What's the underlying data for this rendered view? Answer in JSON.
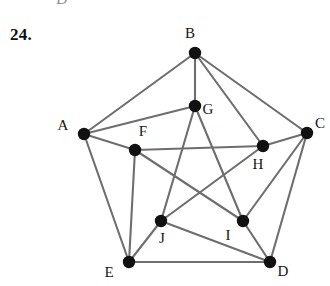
{
  "exercise": {
    "number": "24."
  },
  "page_bleed": {
    "partial_glyph": "D"
  },
  "figure": {
    "canvas": {
      "width": 330,
      "height": 286
    },
    "style": {
      "edge_color": "#6e6e6e",
      "edge_width": 2.1,
      "node_fill": "#111111",
      "node_radius": 6.2,
      "label_color": "#141414",
      "background": "#ffffff"
    },
    "nodes": [
      {
        "id": "A",
        "label": "A",
        "x": 84,
        "y": 134,
        "label_x": 63,
        "label_y": 130
      },
      {
        "id": "B",
        "label": "B",
        "x": 195,
        "y": 53,
        "label_x": 190,
        "label_y": 38
      },
      {
        "id": "C",
        "label": "C",
        "x": 307,
        "y": 133,
        "label_x": 320,
        "label_y": 128
      },
      {
        "id": "D",
        "label": "D",
        "x": 270,
        "y": 262,
        "label_x": 283,
        "label_y": 276
      },
      {
        "id": "E",
        "label": "E",
        "x": 129,
        "y": 262,
        "label_x": 109,
        "label_y": 277
      },
      {
        "id": "F",
        "label": "F",
        "x": 135,
        "y": 150,
        "label_x": 143,
        "label_y": 136
      },
      {
        "id": "G",
        "label": "G",
        "x": 195,
        "y": 106,
        "label_x": 208,
        "label_y": 114
      },
      {
        "id": "H",
        "label": "H",
        "x": 263,
        "y": 146,
        "label_x": 258,
        "label_y": 169
      },
      {
        "id": "I",
        "label": "I",
        "x": 243,
        "y": 221,
        "label_x": 228,
        "label_y": 240
      },
      {
        "id": "J",
        "label": "J",
        "x": 161,
        "y": 221,
        "label_x": 162,
        "label_y": 243
      }
    ],
    "edges": [
      {
        "from": "A",
        "to": "B",
        "group": "outer-pentagon"
      },
      {
        "from": "B",
        "to": "C",
        "group": "outer-pentagon"
      },
      {
        "from": "C",
        "to": "D",
        "group": "outer-pentagon"
      },
      {
        "from": "D",
        "to": "E",
        "group": "outer-pentagon"
      },
      {
        "from": "E",
        "to": "A",
        "group": "outer-pentagon"
      },
      {
        "from": "A",
        "to": "F",
        "group": "spoke"
      },
      {
        "from": "B",
        "to": "G",
        "group": "spoke"
      },
      {
        "from": "C",
        "to": "H",
        "group": "spoke"
      },
      {
        "from": "D",
        "to": "I",
        "group": "spoke"
      },
      {
        "from": "E",
        "to": "J",
        "group": "spoke"
      },
      {
        "from": "F",
        "to": "H",
        "group": "inner-pentagram"
      },
      {
        "from": "H",
        "to": "J",
        "group": "inner-pentagram"
      },
      {
        "from": "J",
        "to": "G",
        "group": "inner-pentagram"
      },
      {
        "from": "G",
        "to": "I",
        "group": "inner-pentagram"
      },
      {
        "from": "I",
        "to": "F",
        "group": "inner-pentagram"
      },
      {
        "from": "A",
        "to": "G",
        "group": "extra-chord"
      },
      {
        "from": "B",
        "to": "H",
        "group": "extra-chord"
      },
      {
        "from": "C",
        "to": "I",
        "group": "extra-chord"
      },
      {
        "from": "D",
        "to": "J",
        "group": "extra-chord"
      },
      {
        "from": "E",
        "to": "F",
        "group": "extra-chord"
      }
    ]
  }
}
